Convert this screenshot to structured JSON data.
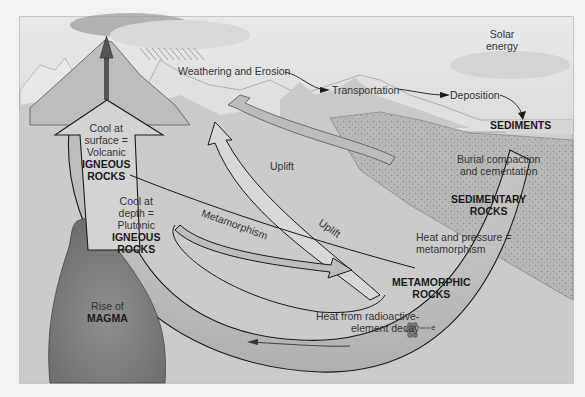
{
  "diagram": {
    "colors": {
      "page_bg": "#f2f2f2",
      "sky": "#e4e4e4",
      "ground": "#c9c9c9",
      "cycle_fill": "#d4d4d4",
      "magma": "#7d7d7d",
      "outline": "#1a1a1a",
      "arrow_fill": "#c2c2c2",
      "sediment": "#b5b5b5"
    },
    "labels": {
      "solar_energy": [
        "Solar",
        "energy"
      ],
      "weathering": "Weathering and Erosion",
      "transportation": "Transportation",
      "deposition": "Deposition",
      "sediments": "SEDIMENTS",
      "burial": [
        "Burial compaction",
        "and cementation"
      ],
      "sedimentary_rocks": [
        "SEDIMENTARY",
        "ROCKS"
      ],
      "heat_pressure": [
        "Heat and pressure =",
        "metamorphism"
      ],
      "metamorphic_rocks": [
        "METAMORPHIC",
        "ROCKS"
      ],
      "radioactive": [
        "Heat from radioactive-",
        "element decay"
      ],
      "electron": "e",
      "uplift_upper": "Uplift",
      "uplift_lower": "Uplift",
      "metamorphism": "Metamorphism",
      "volcanic": {
        "line1": "Cool at",
        "line2": "surface =",
        "line3": "Volcanic",
        "line4": "IGNEOUS",
        "line5": "ROCKS"
      },
      "plutonic": {
        "line1": "Cool at",
        "line2": "depth =",
        "line3": "Plutonic",
        "line4": "IGNEOUS",
        "line5": "ROCKS"
      },
      "magma": {
        "line1": "Rise of",
        "line2": "MAGMA"
      }
    }
  }
}
